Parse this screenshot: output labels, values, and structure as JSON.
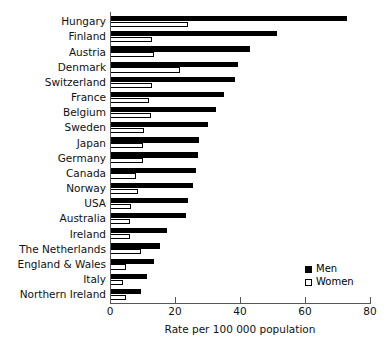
{
  "chart_data": {
    "type": "bar",
    "orientation": "horizontal",
    "title": "",
    "xlabel": "Rate per 100 000 population",
    "ylabel": "",
    "xlim": [
      0,
      80
    ],
    "xticks": [
      0,
      20,
      40,
      60,
      80
    ],
    "grid": false,
    "legend_position": "lower-right",
    "categories": [
      "Hungary",
      "Finland",
      "Austria",
      "Denmark",
      "Switzerland",
      "France",
      "Belgium",
      "Sweden",
      "Japan",
      "Germany",
      "Canada",
      "Norway",
      "USA",
      "Australia",
      "Ireland",
      "The Netherlands",
      "England & Wales",
      "Italy",
      "Northern Ireland"
    ],
    "series": [
      {
        "name": "Men",
        "color": "#000000",
        "values": [
          73.0,
          51.5,
          43.0,
          39.5,
          38.5,
          35.0,
          32.5,
          30.0,
          27.5,
          27.0,
          26.5,
          25.5,
          24.0,
          23.5,
          17.5,
          15.5,
          13.5,
          11.5,
          9.5
        ]
      },
      {
        "name": "Women",
        "color": "#ffffff",
        "values": [
          24.0,
          13.0,
          13.5,
          21.5,
          13.0,
          12.0,
          12.5,
          10.5,
          10.0,
          10.0,
          8.0,
          8.5,
          6.5,
          6.0,
          6.0,
          9.5,
          5.0,
          4.0,
          5.0
        ]
      }
    ]
  },
  "legend": {
    "entries": [
      {
        "label": "Men",
        "swatch": "filled-square"
      },
      {
        "label": "Women",
        "swatch": "open-square"
      }
    ]
  },
  "axis": {
    "x_title": "Rate per 100 000 population",
    "tick_labels": [
      "0",
      "20",
      "40",
      "60",
      "80"
    ]
  }
}
